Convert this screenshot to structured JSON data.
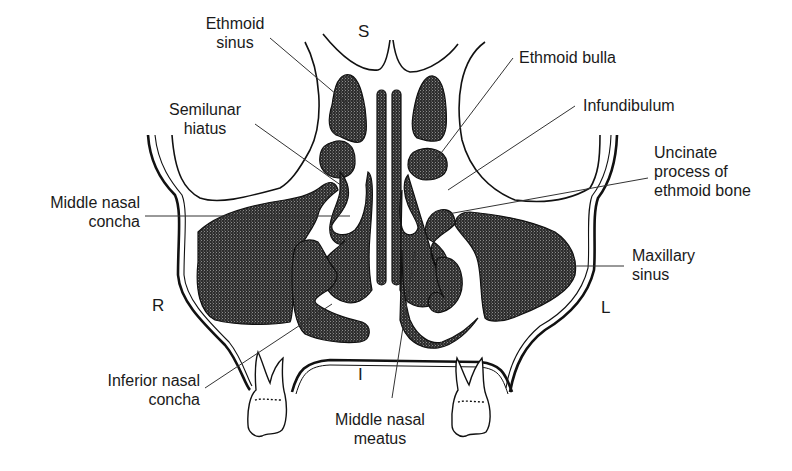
{
  "figure": {
    "type": "anatomical-diagram",
    "colors": {
      "cavity_fill": "#3a3a3a",
      "outline": "#111111",
      "leader_line": "#333333",
      "background": "#ffffff"
    }
  },
  "orientation": {
    "superior": "S",
    "inferior": "I",
    "right": "R",
    "left": "L"
  },
  "labels": {
    "ethmoid_sinus": "Ethmoid\nsinus",
    "semilunar_hiatus": "Semilunar\nhiatus",
    "middle_nasal_concha": "Middle nasal\nconcha",
    "inferior_nasal_concha": "Inferior nasal\nconcha",
    "middle_nasal_meatus": "Middle nasal\nmeatus",
    "ethmoid_bulla": "Ethmoid bulla",
    "infundibulum": "Infundibulum",
    "uncinate_process": "Uncinate\nprocess of\nethmoid bone",
    "maxillary_sinus": "Maxillary\nsinus"
  }
}
